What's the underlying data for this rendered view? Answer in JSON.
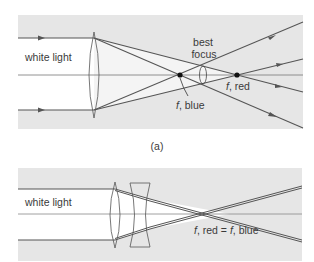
{
  "figure": {
    "panel_a": {
      "label": "(a)",
      "input_label": "white light",
      "best_focus_label_line1": "best",
      "best_focus_label_line2": "focus",
      "focus_blue_label_f": "f",
      "focus_blue_label_rest": ", blue",
      "focus_red_label_f": "f",
      "focus_red_label_rest": ", red",
      "lens_type": "single converging lens",
      "colors": {
        "panel_bg": "#e6e6e6",
        "beam_region": "#ffffff",
        "ray": "#555555",
        "axis": "#777777",
        "focus_point": "#111111"
      }
    },
    "panel_b": {
      "input_label": "white light",
      "focus_label_f1": "f",
      "focus_label_mid": ", red = ",
      "focus_label_f2": "f",
      "focus_label_end": ", blue",
      "lens_type": "achromatic doublet (converging + diverging)",
      "colors": {
        "panel_bg": "#e6e6e6",
        "beam_region": "#ffffff",
        "ray": "#555555",
        "axis": "#777777"
      }
    }
  }
}
